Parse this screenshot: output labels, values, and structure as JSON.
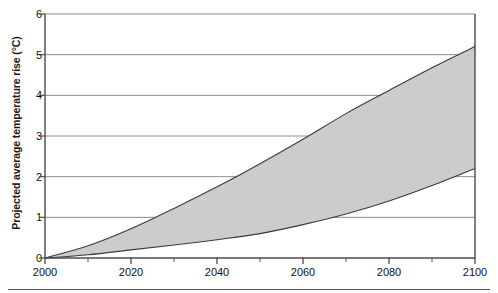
{
  "chart_data": {
    "type": "area",
    "title": "",
    "subtitle": "",
    "xlabel": "",
    "ylabel": "Projected average temperature rise (°C)",
    "xlim": [
      2000,
      2100
    ],
    "ylim": [
      0,
      6
    ],
    "grid": true,
    "grid_axis": "y",
    "legend": "none",
    "x_ticks": [
      2000,
      2020,
      2040,
      2060,
      2080,
      2100
    ],
    "x_tick_labels": [
      "2000",
      "2020",
      "2040",
      "2060",
      "2080",
      "2100"
    ],
    "x_minor_tick_interval": 10,
    "y_ticks": [
      0,
      1,
      2,
      3,
      4,
      5,
      6
    ],
    "y_tick_labels": [
      "0",
      "1",
      "2",
      "3",
      "4",
      "5",
      "6"
    ],
    "band_fill_color": "#cccccc",
    "band_edge_color": "#3a3a3a",
    "axis_color": "#4a4a4a",
    "grid_color": "#8c8c8c",
    "x": [
      2000,
      2010,
      2020,
      2030,
      2040,
      2050,
      2060,
      2070,
      2080,
      2090,
      2100
    ],
    "series": [
      {
        "name": "Upper bound (high emissions)",
        "values": [
          0.0,
          0.3,
          0.72,
          1.22,
          1.75,
          2.32,
          2.92,
          3.55,
          4.12,
          4.68,
          5.2
        ]
      },
      {
        "name": "Lower bound (low emissions)",
        "values": [
          0.0,
          0.08,
          0.2,
          0.32,
          0.45,
          0.6,
          0.82,
          1.08,
          1.4,
          1.78,
          2.2
        ]
      }
    ],
    "annotations": []
  },
  "figure": {
    "y_axis_title": "Projected average temperature rise (°C)"
  }
}
